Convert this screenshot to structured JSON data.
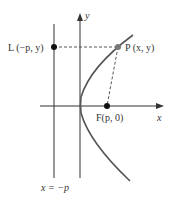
{
  "figure": {
    "axes": {
      "x_label": "x",
      "y_label": "y"
    },
    "directrix": {
      "label": "x = −p"
    },
    "points": {
      "L": {
        "label": "L (−p, y)"
      },
      "P": {
        "label": "P (x, y)"
      },
      "F": {
        "label": "F(p, 0)"
      }
    },
    "colors": {
      "curve": "#555555",
      "axis": "#333333",
      "point": "#111111",
      "point_p": "#777777",
      "dashed": "#444444"
    }
  }
}
